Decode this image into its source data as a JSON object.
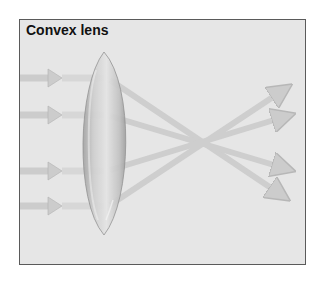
{
  "diagram": {
    "title": "Convex lens",
    "type": "optics-ray-diagram",
    "elements": {
      "lens": {
        "kind": "convex-lens",
        "center_x": 104,
        "top_y": 52,
        "bottom_y": 235,
        "half_width": 28
      },
      "incoming_rays": [
        {
          "y": 78
        },
        {
          "y": 115
        },
        {
          "y": 171
        },
        {
          "y": 206
        }
      ],
      "focal_point": {
        "x": 205,
        "y": 140
      },
      "outgoing_rays": [
        {
          "from_y": 78,
          "to": [
            283,
            197
          ]
        },
        {
          "from_y": 115,
          "to": [
            289,
            169
          ]
        },
        {
          "from_y": 171,
          "to": [
            289,
            116
          ]
        },
        {
          "from_y": 206,
          "to": [
            287,
            88
          ]
        }
      ]
    },
    "colors": {
      "background": "#e6e6e6",
      "frame_border": "#5a5a5a",
      "ray": "#c4c4c4",
      "ray_edge": "#a8a8a8",
      "lens_light": "#dedede",
      "lens_dark": "#9e9e9e"
    }
  }
}
